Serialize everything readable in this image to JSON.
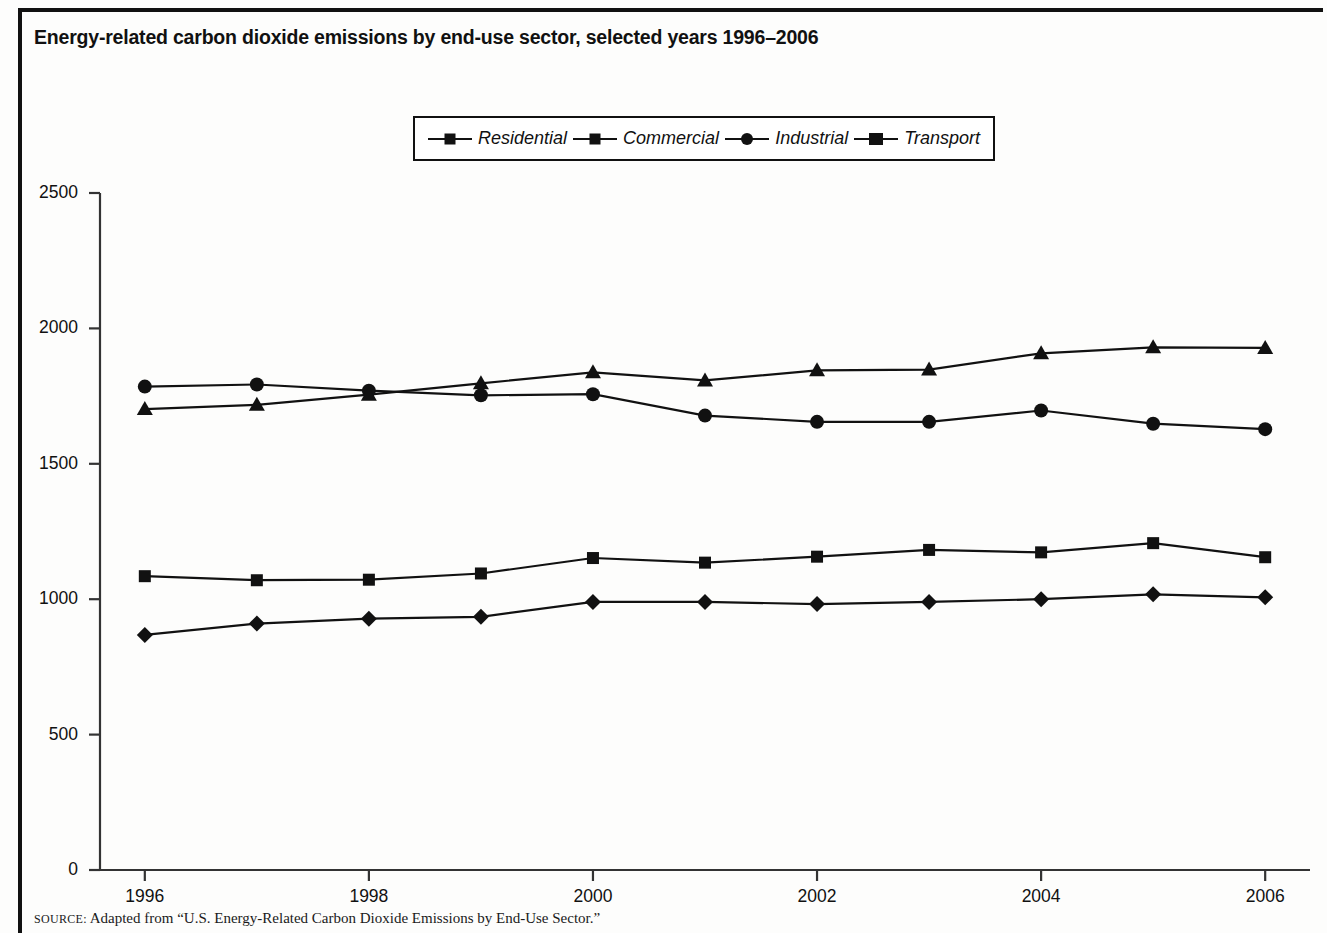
{
  "figure": {
    "title": "Energy-related carbon dioxide emissions by end-use sector, selected years 1996–2006",
    "source_prefix": "SOURCE:",
    "source_text": " Adapted from “U.S. Energy-Related Carbon Dioxide Emissions by End-Use Sector.”"
  },
  "chart_data": {
    "type": "line",
    "title": "Energy-related carbon dioxide emissions by end-use sector, selected years 1996–2006",
    "xlabel": "",
    "ylabel": "",
    "x": [
      1996,
      1997,
      1998,
      1999,
      2000,
      2001,
      2002,
      2003,
      2004,
      2005,
      2006
    ],
    "xlim": [
      1995.6,
      2006.4
    ],
    "ylim": [
      0,
      2500
    ],
    "yticks": [
      0,
      500,
      1000,
      1500,
      2000,
      2500
    ],
    "xticks": [
      1996,
      1998,
      2000,
      2002,
      2004,
      2006
    ],
    "xtick_labels": [
      "1996",
      "1998",
      "2000",
      "2002",
      "2004",
      "2006"
    ],
    "ytick_labels": [
      "0",
      "500",
      "1000",
      "1500",
      "2000",
      "2500"
    ],
    "grid": false,
    "legend_position": "top-center",
    "series": [
      {
        "name": "Residential",
        "marker": "square",
        "values": [
          1085,
          1070,
          1072,
          1095,
          1152,
          1135,
          1157,
          1182,
          1173,
          1207,
          1155
        ]
      },
      {
        "name": "Commercial",
        "marker": "diamond",
        "values": [
          868,
          910,
          928,
          935,
          990,
          990,
          982,
          990,
          1000,
          1018,
          1007
        ]
      },
      {
        "name": "Industrial",
        "marker": "circle",
        "values": [
          1785,
          1793,
          1770,
          1753,
          1757,
          1678,
          1655,
          1655,
          1697,
          1648,
          1628
        ]
      },
      {
        "name": "Transport",
        "marker": "triangle",
        "values": [
          1702,
          1718,
          1755,
          1797,
          1838,
          1808,
          1845,
          1848,
          1908,
          1930,
          1928
        ]
      }
    ]
  },
  "legend": {
    "items": [
      {
        "label": "Residential",
        "marker": "square-marker"
      },
      {
        "label": "Commercial",
        "marker": "diamond-marker"
      },
      {
        "label": "Industrial",
        "marker": "circle-marker"
      },
      {
        "label": "Transport",
        "marker": "triangle-marker"
      }
    ]
  },
  "colors": {
    "line": "#111111",
    "marker": "#111111",
    "axis": "#333333",
    "background": "#ffffff"
  }
}
